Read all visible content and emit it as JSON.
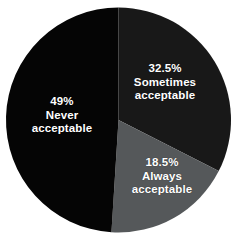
{
  "chart_data": {
    "type": "pie",
    "title": "",
    "subtitle": "",
    "xlabel": "",
    "ylabel": "",
    "legend_position": "none",
    "grid": false,
    "units": "percent",
    "start_angle_deg": 0,
    "direction": "clockwise",
    "categories": [
      "Sometimes acceptable",
      "Always acceptable",
      "Never acceptable"
    ],
    "values": [
      32.5,
      18.5,
      49
    ],
    "slices": [
      {
        "id": "sometimes",
        "label": "Sometimes acceptable",
        "label_line1": "Sometimes",
        "label_line2": "acceptable",
        "value": 32.5,
        "value_text": "32.5%",
        "color": "#181818",
        "start_angle_deg": 0,
        "end_angle_deg": 117
      },
      {
        "id": "always",
        "label": "Always acceptable",
        "label_line1": "Always",
        "label_line2": "acceptable",
        "value": 18.5,
        "value_text": "18.5%",
        "color": "#55585a",
        "start_angle_deg": 117,
        "end_angle_deg": 183.6
      },
      {
        "id": "never",
        "label": "Never acceptable",
        "label_line1": "Never",
        "label_line2": "acceptable",
        "value": 49,
        "value_text": "49%",
        "color": "#050505",
        "start_angle_deg": 183.6,
        "end_angle_deg": 360
      }
    ]
  },
  "canvas": {
    "background": "#ffffff",
    "label_color": "#ffffff"
  }
}
